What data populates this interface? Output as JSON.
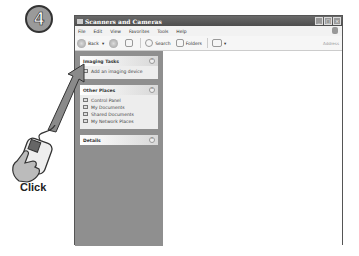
{
  "step": {
    "number": "4"
  },
  "window": {
    "title": "Scanners and Cameras",
    "controls": {
      "minimize": "_",
      "maximize": "□",
      "close": "×"
    },
    "menu": [
      "File",
      "Edit",
      "View",
      "Favorites",
      "Tools",
      "Help"
    ],
    "toolbar": {
      "back": "Back",
      "search": "Search",
      "folders": "Folders",
      "address": "Address"
    }
  },
  "taskpane": {
    "imaging_tasks": {
      "title": "Imaging Tasks",
      "items": [
        "Add an imaging device"
      ]
    },
    "other_places": {
      "title": "Other Places",
      "items": [
        "Control Panel",
        "My Documents",
        "Shared Documents",
        "My Network Places"
      ]
    },
    "details": {
      "title": "Details"
    }
  },
  "annotation": {
    "action": "Click"
  }
}
